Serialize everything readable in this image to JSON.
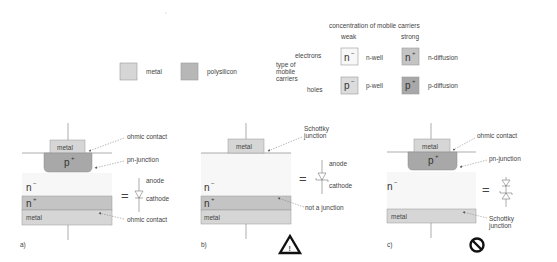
{
  "colors": {
    "metal": "#d6d6d6",
    "polysilicon": "#b7b7b7",
    "n_minus": "#f7f7f7",
    "n_plus": "#c4c4c4",
    "p_minus": "#dcdcdc",
    "p_plus": "#a8a8a8",
    "line": "#777777",
    "arrow": "#666666"
  },
  "legend": {
    "metal_label": "metal",
    "polysilicon_label": "polysilicon",
    "concentration_title": "concentration of mobile carriers",
    "weak_label": "weak",
    "strong_label": "strong",
    "carrier_type_label": [
      "type of",
      "mobile",
      "carriers"
    ],
    "electrons_label": "electrons",
    "holes_label": "holes",
    "cells": {
      "n_minus": {
        "symbol": "n",
        "sup": "−",
        "name": "n-well"
      },
      "n_plus": {
        "symbol": "n",
        "sup": "+",
        "name": "n-diffusion"
      },
      "p_minus": {
        "symbol": "p",
        "sup": "−",
        "name": "p-well"
      },
      "p_plus": {
        "symbol": "p",
        "sup": "+",
        "name": "p-diffusion"
      }
    }
  },
  "panels": [
    {
      "id": "a",
      "caption": "a)",
      "metal_top": "metal",
      "p_plus": {
        "symbol": "p",
        "sup": "+"
      },
      "n_minus": {
        "symbol": "n",
        "sup": "−"
      },
      "n_plus": {
        "symbol": "n",
        "sup": "+"
      },
      "metal_bottom": "metal",
      "annotations": [
        "ohmic contact",
        "pn-junction",
        "ohmic contact"
      ],
      "equals": "=",
      "anode": "anode",
      "cathode": "cathode",
      "status_icon": "none"
    },
    {
      "id": "b",
      "caption": "b)",
      "metal_top": "metal",
      "n_minus": {
        "symbol": "n",
        "sup": "−"
      },
      "n_plus": {
        "symbol": "n",
        "sup": "+"
      },
      "metal_bottom": "metal",
      "annotations": [
        "Schottky",
        "junction",
        "not a junction"
      ],
      "equals": "=",
      "anode": "anode",
      "cathode": "cathode",
      "status_icon": "warning-icon",
      "status_glyph": "!"
    },
    {
      "id": "c",
      "caption": "c)",
      "metal_top": "metal",
      "p_plus": {
        "symbol": "p",
        "sup": "+"
      },
      "n_minus": {
        "symbol": "n",
        "sup": "−"
      },
      "metal_bottom": "metal",
      "annotations": [
        "ohmic contact",
        "pn-junction",
        "Schottky",
        "junction"
      ],
      "equals": "=",
      "status_icon": "prohibited-icon"
    }
  ]
}
